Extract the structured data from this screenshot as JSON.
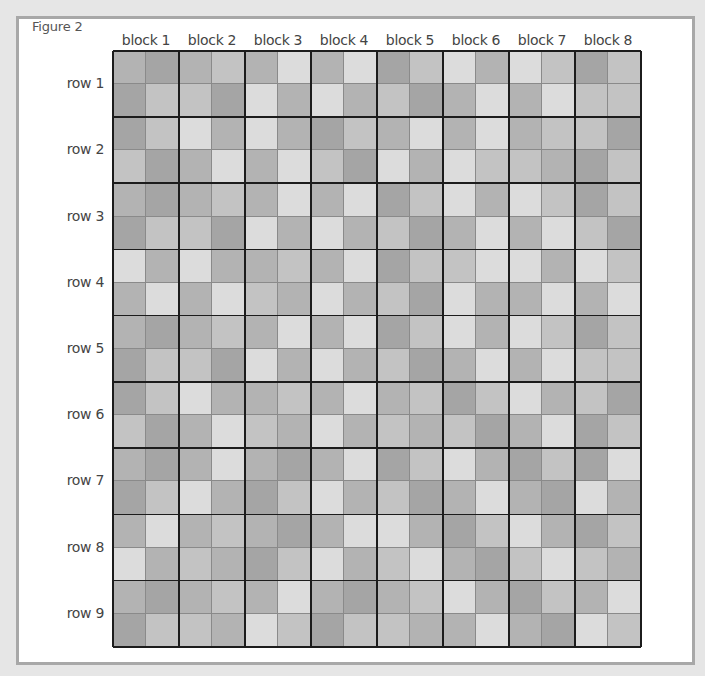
{
  "figure_title": "Figure 2",
  "column_labels": [
    "block 1",
    "block 2",
    "block 3",
    "block 4",
    "block 5",
    "block 6",
    "block 7",
    "block 8"
  ],
  "row_labels": [
    "row 1",
    "row 2",
    "row 3",
    "row 4",
    "row 5",
    "row 6",
    "row 7",
    "row 8",
    "row 9"
  ],
  "shade_legend": {
    "1": "#dcdcdc",
    "2": "#c3c3c3",
    "3": "#b3b3b3",
    "4": "#a5a5a5"
  },
  "cells_per_block": 2,
  "subrows_per_row": 2,
  "shades": [
    [
      3,
      4,
      3,
      2,
      3,
      1,
      3,
      1,
      4,
      2,
      1,
      3,
      1,
      2,
      4,
      2
    ],
    [
      4,
      2,
      2,
      4,
      1,
      3,
      1,
      3,
      2,
      4,
      3,
      1,
      3,
      1,
      2,
      2
    ],
    [
      4,
      2,
      1,
      3,
      1,
      3,
      4,
      2,
      3,
      1,
      3,
      1,
      3,
      2,
      2,
      4
    ],
    [
      2,
      4,
      3,
      1,
      3,
      1,
      2,
      4,
      1,
      3,
      1,
      2,
      2,
      3,
      4,
      2
    ],
    [
      3,
      4,
      3,
      2,
      3,
      1,
      3,
      1,
      4,
      2,
      1,
      3,
      1,
      2,
      4,
      2
    ],
    [
      4,
      2,
      2,
      4,
      1,
      3,
      1,
      3,
      2,
      4,
      3,
      1,
      3,
      1,
      2,
      4
    ],
    [
      1,
      3,
      1,
      3,
      3,
      2,
      3,
      1,
      4,
      2,
      2,
      1,
      1,
      3,
      1,
      2
    ],
    [
      3,
      1,
      3,
      1,
      2,
      3,
      1,
      3,
      2,
      4,
      1,
      3,
      3,
      1,
      3,
      1
    ],
    [
      3,
      4,
      3,
      2,
      3,
      1,
      3,
      1,
      4,
      2,
      1,
      3,
      1,
      2,
      4,
      2
    ],
    [
      4,
      2,
      2,
      4,
      1,
      3,
      1,
      3,
      2,
      4,
      3,
      1,
      3,
      1,
      2,
      2
    ],
    [
      4,
      2,
      1,
      3,
      3,
      2,
      3,
      1,
      3,
      2,
      4,
      2,
      1,
      3,
      2,
      4
    ],
    [
      2,
      4,
      3,
      1,
      2,
      3,
      1,
      3,
      2,
      3,
      2,
      4,
      3,
      1,
      4,
      2
    ],
    [
      3,
      4,
      3,
      1,
      3,
      4,
      3,
      1,
      4,
      2,
      1,
      3,
      4,
      2,
      4,
      1
    ],
    [
      4,
      2,
      1,
      3,
      4,
      2,
      1,
      3,
      2,
      4,
      3,
      1,
      3,
      4,
      1,
      3
    ],
    [
      3,
      1,
      3,
      2,
      3,
      4,
      3,
      1,
      1,
      3,
      4,
      2,
      1,
      3,
      4,
      2
    ],
    [
      1,
      3,
      2,
      3,
      4,
      2,
      1,
      3,
      2,
      1,
      3,
      4,
      2,
      1,
      2,
      3
    ],
    [
      3,
      4,
      3,
      2,
      3,
      1,
      3,
      4,
      3,
      2,
      1,
      3,
      4,
      2,
      3,
      1
    ],
    [
      4,
      2,
      2,
      3,
      1,
      2,
      4,
      2,
      2,
      3,
      3,
      1,
      3,
      4,
      1,
      2
    ]
  ]
}
